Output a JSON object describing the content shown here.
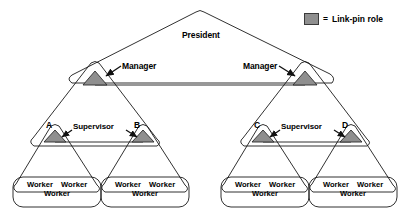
{
  "diagram": {
    "title_text": "President",
    "colors": {
      "stroke": "#1a1a1a",
      "linkpin_fill": "#8f8f8f",
      "background": "#ffffff"
    },
    "levels": {
      "president": {
        "label": "President"
      },
      "managers": [
        {
          "label": "Manager",
          "side": "left"
        },
        {
          "label": "Manager",
          "side": "right"
        }
      ],
      "supervisors": [
        {
          "label": "Supervisor",
          "side": "left"
        },
        {
          "label": "Supervisor",
          "side": "right"
        }
      ],
      "nodes": [
        {
          "label": "A"
        },
        {
          "label": "B"
        },
        {
          "label": "C"
        },
        {
          "label": "D"
        }
      ],
      "worker_groups": [
        {
          "line1_left": "Worker",
          "line1_right": "Worker",
          "line2": "Worker"
        },
        {
          "line1_left": "Worker",
          "line1_right": "Worker",
          "line2": "Worker"
        },
        {
          "line1_left": "Worker",
          "line1_right": "Worker",
          "line2": "Worker"
        },
        {
          "line1_left": "Worker",
          "line1_right": "Worker",
          "line2": "Worker"
        }
      ]
    }
  },
  "legend": {
    "equals": "=",
    "text": "Link-pin role",
    "swatch_color": "#8f8f8f"
  }
}
